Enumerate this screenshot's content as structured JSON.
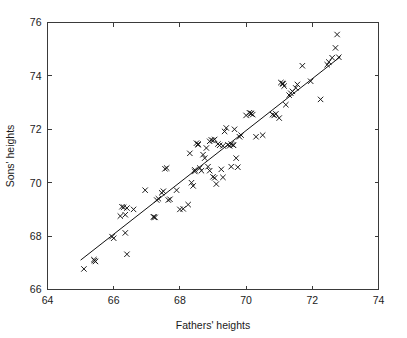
{
  "chart_data": {
    "type": "scatter",
    "title": "",
    "xlabel": "Fathers' heights",
    "ylabel": "Sons' heights",
    "xlim": [
      64,
      74
    ],
    "ylim": [
      66,
      76
    ],
    "xticks": [
      64,
      66,
      68,
      70,
      72,
      74
    ],
    "yticks": [
      66,
      68,
      70,
      72,
      74,
      76
    ],
    "xtick_labels": [
      "64",
      "66",
      "68",
      "70",
      "72",
      "74"
    ],
    "ytick_labels": [
      "66",
      "68",
      "70",
      "72",
      "74",
      "76"
    ],
    "grid": false,
    "legend": null,
    "marker": "x",
    "marker_color": "#111111",
    "frame": "box",
    "tick_direction": "in",
    "series": [
      {
        "name": "fathers-sons-heights",
        "marker": "x",
        "points": [
          [
            65.1,
            66.77
          ],
          [
            65.4,
            67.12
          ],
          [
            65.45,
            67.05
          ],
          [
            65.95,
            67.98
          ],
          [
            66.0,
            67.92
          ],
          [
            66.35,
            68.12
          ],
          [
            66.4,
            67.32
          ],
          [
            66.3,
            69.08
          ],
          [
            66.4,
            69.05
          ],
          [
            66.2,
            68.75
          ],
          [
            66.35,
            68.8
          ],
          [
            66.6,
            69.0
          ],
          [
            66.95,
            69.72
          ],
          [
            67.2,
            68.72
          ],
          [
            67.25,
            68.7
          ],
          [
            67.3,
            69.35
          ],
          [
            67.45,
            69.62
          ],
          [
            67.5,
            69.68
          ],
          [
            67.6,
            70.55
          ],
          [
            67.65,
            69.35
          ],
          [
            67.7,
            69.38
          ],
          [
            67.9,
            69.72
          ],
          [
            68.0,
            69.0
          ],
          [
            68.1,
            69.02
          ],
          [
            68.25,
            69.18
          ],
          [
            68.3,
            71.1
          ],
          [
            68.35,
            70.0
          ],
          [
            68.4,
            69.88
          ],
          [
            68.45,
            70.42
          ],
          [
            68.5,
            71.48
          ],
          [
            68.55,
            71.42
          ],
          [
            68.6,
            70.55
          ],
          [
            68.65,
            70.45
          ],
          [
            68.7,
            71.05
          ],
          [
            68.75,
            70.92
          ],
          [
            68.8,
            71.3
          ],
          [
            68.85,
            70.6
          ],
          [
            68.9,
            71.55
          ],
          [
            68.95,
            71.6
          ],
          [
            69.0,
            71.58
          ],
          [
            69.0,
            70.22
          ],
          [
            69.05,
            70.18
          ],
          [
            69.1,
            69.95
          ],
          [
            69.15,
            71.45
          ],
          [
            69.2,
            71.4
          ],
          [
            69.25,
            70.5
          ],
          [
            69.3,
            71.38
          ],
          [
            69.35,
            71.92
          ],
          [
            69.4,
            72.05
          ],
          [
            69.45,
            71.42
          ],
          [
            69.5,
            71.38
          ],
          [
            69.55,
            70.6
          ],
          [
            69.6,
            71.42
          ],
          [
            69.65,
            72.0
          ],
          [
            69.7,
            70.92
          ],
          [
            69.75,
            70.58
          ],
          [
            69.8,
            71.72
          ],
          [
            69.85,
            71.78
          ],
          [
            70.0,
            72.52
          ],
          [
            70.1,
            72.62
          ],
          [
            70.15,
            72.58
          ],
          [
            70.2,
            72.55
          ],
          [
            70.3,
            71.72
          ],
          [
            70.5,
            71.78
          ],
          [
            70.8,
            72.55
          ],
          [
            70.85,
            72.52
          ],
          [
            71.0,
            72.42
          ],
          [
            71.05,
            73.75
          ],
          [
            71.1,
            73.72
          ],
          [
            71.15,
            73.62
          ],
          [
            71.2,
            72.92
          ],
          [
            71.3,
            73.28
          ],
          [
            71.35,
            73.35
          ],
          [
            71.4,
            73.42
          ],
          [
            71.5,
            73.55
          ],
          [
            71.55,
            73.68
          ],
          [
            71.7,
            74.38
          ],
          [
            71.95,
            73.8
          ],
          [
            72.25,
            73.12
          ],
          [
            72.45,
            74.42
          ],
          [
            72.5,
            74.52
          ],
          [
            72.6,
            74.68
          ],
          [
            72.7,
            75.05
          ],
          [
            72.75,
            75.55
          ],
          [
            72.8,
            74.7
          ],
          [
            67.55,
            70.52
          ],
          [
            68.9,
            70.45
          ],
          [
            69.05,
            71.62
          ],
          [
            69.55,
            71.45
          ],
          [
            70.15,
            72.6
          ],
          [
            66.25,
            69.1
          ],
          [
            67.35,
            69.4
          ],
          [
            68.45,
            70.48
          ],
          [
            69.3,
            70.2
          ],
          [
            70.9,
            72.58
          ],
          [
            65.42,
            67.08
          ],
          [
            67.22,
            68.71
          ],
          [
            68.55,
            71.45
          ],
          [
            69.62,
            71.4
          ],
          [
            71.12,
            73.7
          ]
        ]
      }
    ],
    "fit_line": {
      "name": "regression-line",
      "x_start": 65.0,
      "x_end": 72.85,
      "y_start": 67.1,
      "y_end": 74.72
    }
  }
}
